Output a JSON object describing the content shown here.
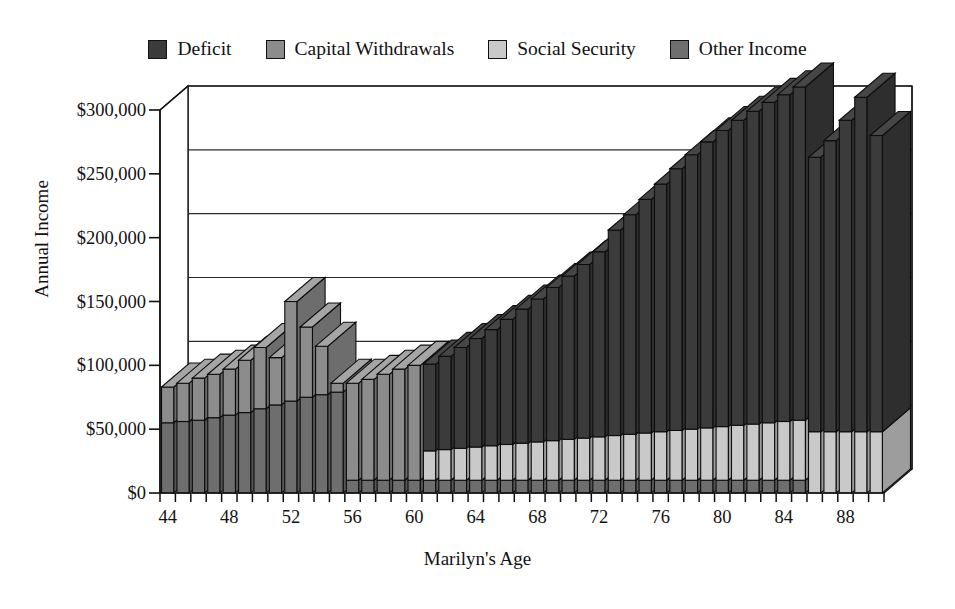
{
  "chart_data": {
    "type": "bar",
    "subtype": "stacked-3d-column",
    "title": "",
    "xlabel": "Marilyn's  Age",
    "ylabel": "Annual Income",
    "ylim": [
      0,
      300000
    ],
    "ytick_values": [
      0,
      50000,
      100000,
      150000,
      200000,
      250000,
      300000
    ],
    "ytick_labels": [
      "$0",
      "$50,000",
      "$100,000",
      "$150,000",
      "$200,000",
      "$250,000",
      "$300,000"
    ],
    "grid": true,
    "grid_axis": "y",
    "legend_position": "top",
    "x": [
      44,
      45,
      46,
      47,
      48,
      49,
      50,
      51,
      52,
      53,
      54,
      55,
      56,
      57,
      58,
      59,
      60,
      61,
      62,
      63,
      64,
      65,
      66,
      67,
      68,
      69,
      70,
      71,
      72,
      73,
      74,
      75,
      76,
      77,
      78,
      79,
      80,
      81,
      82,
      83,
      84,
      85,
      86,
      87,
      88,
      89,
      90
    ],
    "xtick_labels": [
      "44",
      "48",
      "52",
      "56",
      "60",
      "64",
      "68",
      "72",
      "76",
      "80",
      "84",
      "88"
    ],
    "xtick_values": [
      44,
      48,
      52,
      56,
      60,
      64,
      68,
      72,
      76,
      80,
      84,
      88
    ],
    "stack_order": [
      "Other Income",
      "Social Security",
      "Capital Withdrawals",
      "Deficit"
    ],
    "series": [
      {
        "name": "Other Income",
        "color": "#6e6e6e",
        "values": [
          55000,
          56000,
          57000,
          59000,
          61000,
          63000,
          66000,
          69000,
          72000,
          75000,
          77000,
          79000,
          10000,
          10000,
          10000,
          10000,
          10000,
          10000,
          10000,
          10000,
          10000,
          10000,
          10000,
          10000,
          10000,
          10000,
          10000,
          10000,
          10000,
          10000,
          10000,
          10000,
          10000,
          10000,
          10000,
          10000,
          10000,
          10000,
          10000,
          10000,
          10000,
          10000,
          0,
          0,
          0,
          0,
          0
        ]
      },
      {
        "name": "Social Security",
        "color": "#c9c9c9",
        "values": [
          0,
          0,
          0,
          0,
          0,
          0,
          0,
          0,
          0,
          0,
          0,
          0,
          0,
          0,
          0,
          0,
          0,
          23000,
          24000,
          25000,
          26000,
          27000,
          28000,
          29000,
          30000,
          31000,
          32000,
          33000,
          34000,
          35000,
          36000,
          37000,
          38000,
          39000,
          40000,
          41000,
          42000,
          43000,
          44000,
          45000,
          46000,
          47000,
          48000,
          48000,
          48000,
          48000,
          48000
        ]
      },
      {
        "name": "Capital Withdrawals",
        "color": "#8c8c8c",
        "values": [
          28000,
          30000,
          33000,
          34000,
          36000,
          41000,
          48000,
          37000,
          78000,
          55000,
          38000,
          7000,
          76000,
          79000,
          83000,
          87000,
          90000,
          0,
          0,
          0,
          0,
          0,
          0,
          0,
          0,
          0,
          0,
          0,
          0,
          0,
          0,
          0,
          0,
          0,
          0,
          0,
          0,
          0,
          0,
          0,
          0,
          0,
          0,
          0,
          0,
          0,
          0
        ]
      },
      {
        "name": "Deficit",
        "color": "#3b3b3b",
        "values": [
          0,
          0,
          0,
          0,
          0,
          0,
          0,
          0,
          0,
          0,
          0,
          0,
          0,
          0,
          0,
          0,
          0,
          68000,
          73000,
          79000,
          85000,
          91000,
          98000,
          105000,
          112000,
          120000,
          128000,
          136000,
          145000,
          161000,
          172000,
          183000,
          194000,
          205000,
          215000,
          224000,
          232000,
          239000,
          245000,
          251000,
          256000,
          261000,
          215000,
          228000,
          244000,
          262000,
          232000
        ]
      }
    ],
    "totals": [
      83000,
      86000,
      90000,
      93000,
      97000,
      104000,
      114000,
      106000,
      150000,
      130000,
      115000,
      86000,
      86000,
      89000,
      93000,
      97000,
      100000,
      91000,
      97000,
      104000,
      111000,
      118000,
      126000,
      134000,
      142000,
      151000,
      160000,
      169000,
      179000,
      196000,
      208000,
      220000,
      232000,
      244000,
      255000,
      265000,
      274000,
      282000,
      289000,
      296000,
      302000,
      308000,
      263000,
      276000,
      292000,
      310000,
      280000
    ]
  },
  "legend": {
    "items": [
      {
        "label": "Deficit",
        "color": "#3b3b3b",
        "swatch_name": "legend-swatch-deficit"
      },
      {
        "label": "Capital Withdrawals",
        "color": "#8c8c8c",
        "swatch_name": "legend-swatch-capital-withdrawals"
      },
      {
        "label": "Social Security",
        "color": "#c9c9c9",
        "swatch_name": "legend-swatch-social-security"
      },
      {
        "label": "Other Income",
        "color": "#6e6e6e",
        "swatch_name": "legend-swatch-other-income"
      }
    ]
  },
  "colors": {
    "deficit": "#3b3b3b",
    "capital_withdrawals": "#8c8c8c",
    "social_security": "#c9c9c9",
    "other_income": "#6e6e6e",
    "axis": "#101010",
    "grid": "#2a2a2a",
    "background": "#ffffff"
  }
}
